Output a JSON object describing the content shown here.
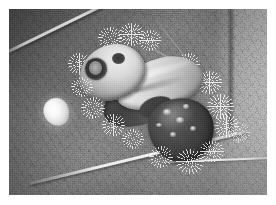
{
  "image": {
    "kind": "natural-photograph",
    "title": "Spiny caterpillar resting on a leaf",
    "color_mode": "grayscale",
    "width_px": 276,
    "height_px": 205,
    "border": {
      "style": "solid white paper margin",
      "color": "#ffffff",
      "left_px": 9,
      "top_px": 9,
      "right_px": 9,
      "bottom_px": 10
    },
    "plate": {
      "width_px": 258,
      "height_px": 186
    }
  },
  "scene": {
    "subject": "caterpillar",
    "subject_description": "stout spiny moth larva with pale cream dorsal saddle, dark brown rear segment and branched setae tufts",
    "setting": "upper surface of a broad leaf",
    "orientation": "diagonal, head upper-left, rear lower-right",
    "focus": "shallow depth of field, background out of focus at right"
  },
  "subject": {
    "head": {
      "name": "anterior head and thorax",
      "tone": "pale cream",
      "markings": "dark oval ring marking and a smaller dark spot"
    },
    "dorsal_saddle": {
      "name": "pale dorsal saddle",
      "tone": "cream to light grey"
    },
    "midbody": {
      "name": "constricted mid body",
      "tone": "dark grey-brown"
    },
    "rear": {
      "name": "posterior segment",
      "tone": "dark brown",
      "markings": "scattered small pale spots"
    },
    "setae": {
      "name": "branched spiny tufts",
      "count_visible": 17,
      "tone": "bright white, radiating"
    }
  },
  "background": {
    "leaf": {
      "name": "leaf lamina",
      "texture": "fine reticulated vein network",
      "major_veins": [
        {
          "name": "upper-left diagonal rib",
          "brightness": "bright"
        },
        {
          "name": "lower diagonal rib",
          "brightness": "bright"
        },
        {
          "name": "mid-right minor vein",
          "brightness": "faint"
        },
        {
          "name": "top-right minor vein",
          "brightness": "faint"
        }
      ],
      "leaf_margin_highlight": "bright horizontal edge across lower right",
      "leaf_edge_right": "dark vertical leaf margin near right side"
    },
    "out_of_focus_region": {
      "name": "blurred pale background",
      "position": "right side",
      "tone": "light grey"
    }
  },
  "objects": [
    {
      "name": "white ovoid object",
      "description": "small bright white egg-like ovoid on the leaf",
      "position": "left of the caterpillar",
      "tone": "white"
    }
  ],
  "palette": {
    "paper_white": "#ffffff",
    "leaf_light": "#a9a9a9",
    "leaf_mid": "#8a8a8a",
    "leaf_dark": "#6f6f6f",
    "saddle_cream": "#f2efe6",
    "body_dark": "#3e3a35",
    "setae_white": "#fafaf8",
    "eyespot_dark": "#2e2b28"
  }
}
